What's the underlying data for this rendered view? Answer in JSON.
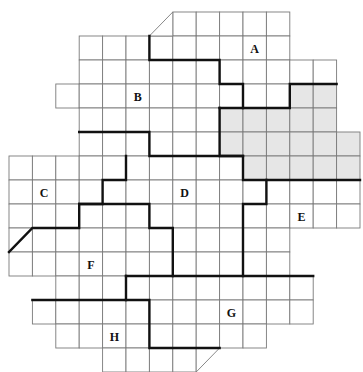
{
  "figure": {
    "type": "grid-region-map",
    "grid": {
      "origin_x": 9,
      "origin_y": 12,
      "cell_w": 23.4,
      "cell_h": 24
    },
    "rows": [
      {
        "row": 0,
        "from": 7,
        "to": 11
      },
      {
        "row": 1,
        "from": 3,
        "to": 11
      },
      {
        "row": 2,
        "from": 3,
        "to": 13
      },
      {
        "row": 3,
        "from": 2,
        "to": 13
      },
      {
        "row": 4,
        "from": 3,
        "to": 13
      },
      {
        "row": 5,
        "from": 3,
        "to": 14
      },
      {
        "row": 6,
        "from": 0,
        "to": 14
      },
      {
        "row": 7,
        "from": 0,
        "to": 14
      },
      {
        "row": 8,
        "from": 0,
        "to": 14
      },
      {
        "row": 9,
        "from": 0,
        "to": 11
      },
      {
        "row": 10,
        "from": 0,
        "to": 11
      },
      {
        "row": 11,
        "from": 2,
        "to": 12
      },
      {
        "row": 12,
        "from": 1,
        "to": 12
      },
      {
        "row": 13,
        "from": 2,
        "to": 10
      },
      {
        "row": 14,
        "from": 4,
        "to": 7
      }
    ],
    "triangles": [
      {
        "name": "top-corner-cut",
        "points": [
          [
            6,
            1
          ],
          [
            7,
            0
          ],
          [
            7,
            1
          ]
        ]
      },
      {
        "name": "bottom-corner-cut",
        "points": [
          [
            8,
            14
          ],
          [
            9,
            14
          ],
          [
            8,
            15
          ]
        ]
      }
    ],
    "shaded_cells": [
      [
        3,
        12
      ],
      [
        3,
        13
      ],
      [
        4,
        9
      ],
      [
        4,
        10
      ],
      [
        4,
        11
      ],
      [
        4,
        12
      ],
      [
        4,
        13
      ],
      [
        5,
        9
      ],
      [
        5,
        10
      ],
      [
        5,
        11
      ],
      [
        5,
        12
      ],
      [
        5,
        13
      ],
      [
        5,
        14
      ],
      [
        6,
        10
      ],
      [
        6,
        11
      ],
      [
        6,
        12
      ],
      [
        6,
        13
      ],
      [
        6,
        14
      ]
    ],
    "region_borders": [
      {
        "name": "border-a-b",
        "points": [
          [
            6,
            1
          ],
          [
            6,
            2
          ],
          [
            9,
            2
          ],
          [
            9,
            3
          ],
          [
            10,
            3
          ],
          [
            10,
            4
          ]
        ]
      },
      {
        "name": "border-a-shaded",
        "points": [
          [
            9,
            4
          ],
          [
            12,
            4
          ],
          [
            12,
            3
          ],
          [
            14,
            3
          ]
        ]
      },
      {
        "name": "border-shaded-d-e",
        "points": [
          [
            9,
            4
          ],
          [
            9,
            6
          ],
          [
            10,
            6
          ],
          [
            10,
            7
          ],
          [
            15,
            7
          ]
        ]
      },
      {
        "name": "border-b-d",
        "points": [
          [
            3,
            5
          ],
          [
            6,
            5
          ],
          [
            6,
            6
          ],
          [
            10,
            6
          ]
        ]
      },
      {
        "name": "border-c-d-f",
        "points": [
          [
            5,
            6
          ],
          [
            5,
            7
          ],
          [
            4,
            7
          ],
          [
            4,
            8
          ],
          [
            3,
            8
          ],
          [
            3,
            9
          ],
          [
            1,
            9
          ],
          [
            0,
            10
          ]
        ]
      },
      {
        "name": "border-d-f",
        "points": [
          [
            3,
            8
          ],
          [
            6,
            8
          ],
          [
            6,
            9
          ],
          [
            7,
            9
          ],
          [
            7,
            11
          ]
        ]
      },
      {
        "name": "border-d-e",
        "points": [
          [
            11,
            7
          ],
          [
            11,
            8
          ],
          [
            10,
            8
          ],
          [
            10,
            11
          ]
        ]
      },
      {
        "name": "border-f-g",
        "points": [
          [
            5,
            11
          ],
          [
            13,
            11
          ]
        ]
      },
      {
        "name": "border-f-h-g",
        "points": [
          [
            5,
            11
          ],
          [
            5,
            12
          ],
          [
            1,
            12
          ]
        ]
      },
      {
        "name": "border-h-g",
        "points": [
          [
            5,
            12
          ],
          [
            6,
            12
          ],
          [
            6,
            14
          ],
          [
            9,
            14
          ]
        ]
      }
    ],
    "labels": [
      {
        "text": "A",
        "col": 10,
        "row": 1
      },
      {
        "text": "B",
        "col": 5,
        "row": 3
      },
      {
        "text": "C",
        "col": 1,
        "row": 7
      },
      {
        "text": "D",
        "col": 7,
        "row": 7
      },
      {
        "text": "E",
        "col": 12,
        "row": 8
      },
      {
        "text": "F",
        "col": 3,
        "row": 10
      },
      {
        "text": "G",
        "col": 9,
        "row": 12
      },
      {
        "text": "H",
        "col": 4,
        "row": 13
      }
    ],
    "colors": {
      "shade": "#e6e6e6",
      "grid_line": "#7a7a7a",
      "border_line": "#111111",
      "label": "#111111"
    }
  }
}
